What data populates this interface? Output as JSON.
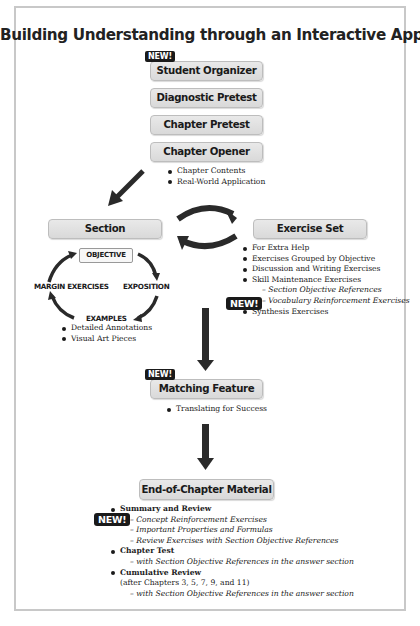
{
  "title": "Building Understanding through an Interactive Approach",
  "new_label": "NEW!",
  "top_boxes": [
    {
      "label": "Student Organizer",
      "new": true
    },
    {
      "label": "Diagnostic Pretest",
      "new": false
    },
    {
      "label": "Chapter Pretest",
      "new": false
    },
    {
      "label": "Chapter Opener",
      "new": false
    }
  ],
  "chapter_opener_items": [
    "Chapter Contents",
    "Real-World Application"
  ],
  "section": {
    "label": "Section",
    "cycle": {
      "objective": "OBJECTIVE",
      "exposition": "EXPOSITION",
      "examples": "EXAMPLES",
      "margin_exercises": "MARGIN EXERCISES"
    },
    "items": [
      "Detailed Annotations",
      "Visual Art Pieces"
    ]
  },
  "exercise_set": {
    "label": "Exercise Set",
    "items": [
      "For Extra Help",
      "Exercises Grouped by Objective",
      "Discussion and Writing Exercises",
      "Skill Maintenance Exercises"
    ],
    "sub_items": [
      "– Section Objective References",
      "– Vocabulary Reinforcement Exercises"
    ],
    "last_item": "Synthesis Exercises"
  },
  "matching_feature": {
    "label": "Matching Feature",
    "items": [
      "Translating for Success"
    ]
  },
  "end_of_chapter": {
    "label": "End-of-Chapter Material",
    "summary": "Summary and Review",
    "summary_subs": [
      "– Concept Reinforcement Exercises",
      "– Important Properties and Formulas",
      "– Review Exercises with Section Objective References"
    ],
    "chapter_test": "Chapter Test",
    "chapter_test_sub": "– with Section Objective References in the answer section",
    "cumulative": "Cumulative Review",
    "cumulative_note": "(after Chapters 3, 5, 7, 9, and 11)",
    "cumulative_sub": "– with Section Objective References in the answer section"
  },
  "colors": {
    "box_fill": "#dedede",
    "box_border": "#bdbdbd",
    "arrow": "#2a2a2a",
    "new_badge": "#1a1a1a",
    "frame": "#c8c8c8"
  }
}
